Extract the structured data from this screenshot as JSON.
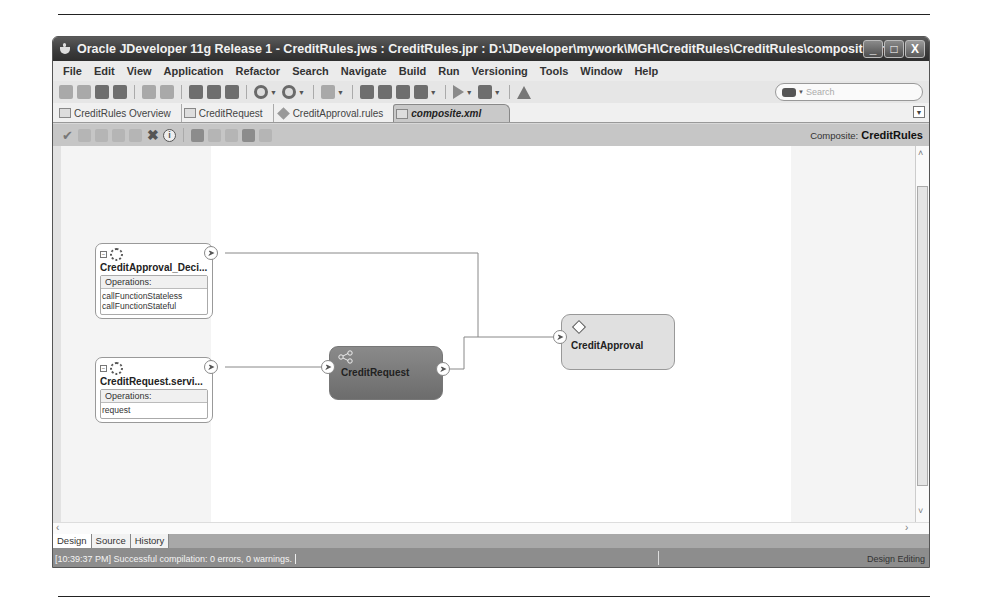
{
  "window": {
    "title": "Oracle JDeveloper 11g Release 1 - CreditRules.jws : CreditRules.jpr : D:\\JDeveloper\\mywork\\MGH\\CreditRules\\CreditRules\\composite.xml",
    "controls": {
      "minimize": "_",
      "maximize": "□",
      "close": "X"
    }
  },
  "menubar": {
    "items": [
      {
        "label": "File",
        "mnemonic": "F"
      },
      {
        "label": "Edit",
        "mnemonic": "E"
      },
      {
        "label": "View",
        "mnemonic": "V"
      },
      {
        "label": "Application",
        "mnemonic": "A"
      },
      {
        "label": "Refactor",
        "mnemonic": "c"
      },
      {
        "label": "Search",
        "mnemonic": "S"
      },
      {
        "label": "Navigate",
        "mnemonic": "N"
      },
      {
        "label": "Build",
        "mnemonic": "B"
      },
      {
        "label": "Run",
        "mnemonic": "R"
      },
      {
        "label": "Versioning",
        "mnemonic": "i"
      },
      {
        "label": "Tools",
        "mnemonic": "T"
      },
      {
        "label": "Window",
        "mnemonic": "W"
      },
      {
        "label": "Help",
        "mnemonic": "H"
      }
    ]
  },
  "toolbar": {
    "icons": [
      "new-icon",
      "open-icon",
      "save-icon",
      "save-all-icon",
      "undo-icon",
      "redo-icon",
      "cut-icon",
      "copy-icon",
      "paste-icon",
      "back-icon",
      "forward-icon",
      "deploy-icon",
      "make-icon",
      "rebuild-icon",
      "clean-icon",
      "database-icon",
      "run-icon",
      "debug-icon",
      "warning-icon"
    ],
    "search_placeholder": "Search"
  },
  "doc_tabs": [
    {
      "label": "CreditRules Overview",
      "active": false
    },
    {
      "label": "CreditRequest",
      "active": false
    },
    {
      "label": "CreditApproval.rules",
      "active": false
    },
    {
      "label": "composite.xml",
      "active": true
    }
  ],
  "design_toolbar": {
    "icons": [
      "validate-icon",
      "wire-icon",
      "antenna-icon",
      "expand-icon",
      "collapse-icon",
      "delete-icon",
      "info-icon",
      "zoom-icon",
      "layout-icon",
      "refresh-icon",
      "deploy-icon",
      "undo-icon"
    ],
    "composite_label": "Composite:",
    "composite_name": "CreditRules"
  },
  "canvas": {
    "services": [
      {
        "name": "CreditApproval_Deci...",
        "ops_header": "Operations:",
        "operations": [
          "callFunctionStateless",
          "callFunctionStateful"
        ]
      },
      {
        "name": "CreditRequest.servi...",
        "ops_header": "Operations:",
        "operations": [
          "request"
        ]
      }
    ],
    "components": [
      {
        "name": "CreditRequest",
        "type": "bpel"
      },
      {
        "name": "CreditApproval",
        "type": "rules"
      }
    ]
  },
  "bottom_tabs": [
    {
      "label": "Design",
      "active": true
    },
    {
      "label": "Source",
      "active": false
    },
    {
      "label": "History",
      "active": false
    }
  ],
  "status": {
    "message": "[10:39:37 PM] Successful compilation: 0 errors, 0 warnings.",
    "mode": "Design Editing"
  }
}
